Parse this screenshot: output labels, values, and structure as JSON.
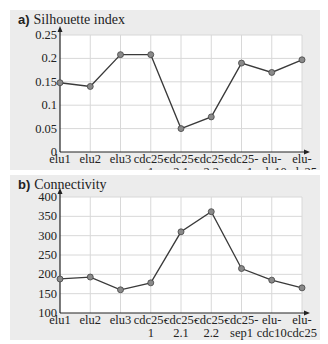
{
  "chart_data": [
    {
      "type": "line",
      "panel_label": "a)",
      "title": "Silhouette index",
      "categories": [
        "elu1",
        "elu2",
        "elu3",
        "cdc25-1",
        "cdc25-2.1",
        "cdc25-2.2",
        "cdc25-sep1",
        "elu-cdc10",
        "elu-cdc25"
      ],
      "category_lines": [
        [
          "elu1"
        ],
        [
          "elu2"
        ],
        [
          "elu3"
        ],
        [
          "cdc25-",
          "1"
        ],
        [
          "cdc25-",
          "2.1"
        ],
        [
          "cdc25-",
          "2.2"
        ],
        [
          "cdc25-",
          "sep1"
        ],
        [
          "elu-",
          "cdc10"
        ],
        [
          "elu-",
          "cdc25"
        ]
      ],
      "values": [
        0.148,
        0.14,
        0.208,
        0.208,
        0.05,
        0.075,
        0.19,
        0.17,
        0.197
      ],
      "ylim": [
        0,
        0.25
      ],
      "yticks": [
        "0",
        "0.05",
        "0.1",
        "0.15",
        "0.2",
        "0.25"
      ],
      "ytick_values": [
        0,
        0.05,
        0.1,
        0.15,
        0.2,
        0.25
      ],
      "grid": true,
      "xlabel": "",
      "ylabel": ""
    },
    {
      "type": "line",
      "panel_label": "b)",
      "title": "Connectivity",
      "categories": [
        "elu1",
        "elu2",
        "elu3",
        "cdc25-1",
        "cdc25-2.1",
        "cdc25-2.2",
        "cdc25-sep1",
        "elu-cdc10",
        "elu-cdc25"
      ],
      "category_lines": [
        [
          "elu1"
        ],
        [
          "elu2"
        ],
        [
          "elu3"
        ],
        [
          "cdc25-",
          "1"
        ],
        [
          "cdc25-",
          "2.1"
        ],
        [
          "cdc25-",
          "2.2"
        ],
        [
          "cdc25-",
          "sep1"
        ],
        [
          "elu-",
          "cdc10"
        ],
        [
          "elu-",
          "cdc25"
        ]
      ],
      "values": [
        188,
        193,
        160,
        178,
        310,
        362,
        215,
        185,
        165
      ],
      "ylim": [
        100,
        400
      ],
      "yticks": [
        "100",
        "150",
        "200",
        "250",
        "300",
        "350",
        "400"
      ],
      "ytick_values": [
        100,
        150,
        200,
        250,
        300,
        350,
        400
      ],
      "grid": true,
      "xlabel": "",
      "ylabel": ""
    }
  ],
  "colors": {
    "panel_bg": "#ececec",
    "plot_bg": "#ffffff",
    "grid": "#d8d8d8",
    "line": "#3a3a3a",
    "marker": "#8a8a8a"
  }
}
